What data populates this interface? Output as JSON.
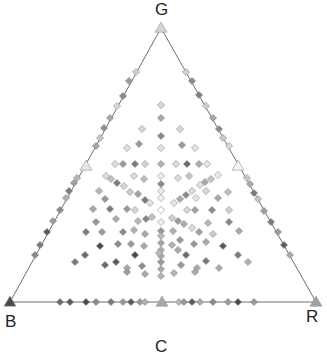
{
  "chart_data": {
    "type": "scatter",
    "subtype": "ternary",
    "title": "",
    "vertices": [
      {
        "label": "G",
        "x": 161,
        "y": 28,
        "marker": "triangle",
        "color": "#d4d4d4"
      },
      {
        "label": "B",
        "x": 10,
        "y": 302,
        "marker": "triangle",
        "color": "#4a4a4a"
      },
      {
        "label": "R",
        "x": 316,
        "y": 302,
        "marker": "triangle",
        "color": "#a0a0a0"
      }
    ],
    "edge_midpoints": [
      {
        "x": 86,
        "y": 166,
        "marker": "triangle",
        "color": "#e6e6e6"
      },
      {
        "x": 238,
        "y": 166,
        "marker": "triangle",
        "color": "#f4f4f4"
      },
      {
        "x": 162,
        "y": 302,
        "marker": "triangle",
        "color": "#a8a8a8"
      }
    ],
    "bottom_label_partial": "C",
    "points": [
      [
        136,
        72,
        "#d0d0d0"
      ],
      [
        129,
        81,
        "#9a9a9a"
      ],
      [
        123,
        96,
        "#8a8a8a"
      ],
      [
        117,
        106,
        "#d6d6d6"
      ],
      [
        110,
        118,
        "#a8a8a8"
      ],
      [
        104,
        128,
        "#8e8e8e"
      ],
      [
        100,
        138,
        "#c6c6c6"
      ],
      [
        96,
        146,
        "#a4a4a4"
      ],
      [
        77,
        178,
        "#b6b6b6"
      ],
      [
        74,
        183,
        "#9c9c9c"
      ],
      [
        69,
        191,
        "#7c7c7c"
      ],
      [
        66,
        198,
        "#b0b0b0"
      ],
      [
        60,
        210,
        "#8a8a8a"
      ],
      [
        53,
        221,
        "#9a9a9a"
      ],
      [
        47,
        232,
        "#5a5a5a"
      ],
      [
        40,
        245,
        "#7a7a7a"
      ],
      [
        35,
        255,
        "#888888"
      ],
      [
        186,
        72,
        "#d0d0d0"
      ],
      [
        192,
        81,
        "#8a8a8a"
      ],
      [
        199,
        95,
        "#7e7e7e"
      ],
      [
        206,
        106,
        "#cfcfcf"
      ],
      [
        213,
        118,
        "#a8a8a8"
      ],
      [
        219,
        129,
        "#8c8c8c"
      ],
      [
        223,
        138,
        "#c8c8c8"
      ],
      [
        229,
        146,
        "#d8d8d8"
      ],
      [
        247,
        178,
        "#c8c8c8"
      ],
      [
        250,
        184,
        "#a8a8a8"
      ],
      [
        254,
        193,
        "#7a7a7a"
      ],
      [
        258,
        199,
        "#c4c4c4"
      ],
      [
        264,
        211,
        "#9c9c9c"
      ],
      [
        271,
        222,
        "#7a7a7a"
      ],
      [
        278,
        232,
        "#9a9a9a"
      ],
      [
        284,
        245,
        "#5a5a5a"
      ],
      [
        290,
        255,
        "#aaaaaa"
      ],
      [
        60,
        302,
        "#6a6a6a"
      ],
      [
        70,
        302,
        "#5a5a5a"
      ],
      [
        86,
        302,
        "#4a4a4a"
      ],
      [
        96,
        302,
        "#888888"
      ],
      [
        111,
        302,
        "#777777"
      ],
      [
        123,
        302,
        "#999999"
      ],
      [
        131,
        302,
        "#5a5a5a"
      ],
      [
        140,
        302,
        "#999999"
      ],
      [
        145,
        302,
        "#b0b0b0"
      ],
      [
        179,
        302,
        "#b8b8b8"
      ],
      [
        184,
        302,
        "#999999"
      ],
      [
        192,
        302,
        "#5a5a5a"
      ],
      [
        200,
        302,
        "#a8a8a8"
      ],
      [
        213,
        302,
        "#888888"
      ],
      [
        228,
        302,
        "#999999"
      ],
      [
        238,
        302,
        "#4a4a4a"
      ],
      [
        254,
        302,
        "#9a9a9a"
      ],
      [
        161,
        105,
        "#d6d6d6"
      ],
      [
        161,
        118,
        "#a8a8a8"
      ],
      [
        161,
        136,
        "#8a8a8a"
      ],
      [
        161,
        148,
        "#e2e2e2"
      ],
      [
        161,
        164,
        "#b0b0b0"
      ],
      [
        161,
        176,
        "#eeeeee"
      ],
      [
        161,
        184,
        "#8a8a8a"
      ],
      [
        161,
        191,
        "#eeeeee"
      ],
      [
        161,
        198,
        "#f0f0f0"
      ],
      [
        161,
        210,
        "#ffffff"
      ],
      [
        161,
        222,
        "#f0f0f0"
      ],
      [
        161,
        231,
        "#999999"
      ],
      [
        161,
        236,
        "#b8b8b8"
      ],
      [
        161,
        243,
        "#a8a8a8"
      ],
      [
        161,
        250,
        "#b0b0b0"
      ],
      [
        161,
        256,
        "#aaaaaa"
      ],
      [
        161,
        262,
        "#999999"
      ],
      [
        161,
        269,
        "#aaaaaa"
      ],
      [
        161,
        276,
        "#b4b4b4"
      ],
      [
        142,
        129,
        "#d6d6d6"
      ],
      [
        180,
        129,
        "#d6d6d6"
      ],
      [
        139,
        144,
        "#9a9a9a"
      ],
      [
        182,
        145,
        "#9a9a9a"
      ],
      [
        127,
        148,
        "#e0e0e0"
      ],
      [
        195,
        148,
        "#e6e6e6"
      ],
      [
        115,
        164,
        "#dcdcdc"
      ],
      [
        123,
        164,
        "#9a9a9a"
      ],
      [
        135,
        164,
        "#7a7a7a"
      ],
      [
        145,
        164,
        "#d4d4d4"
      ],
      [
        176,
        164,
        "#dcdcdc"
      ],
      [
        187,
        164,
        "#6a6a6a"
      ],
      [
        199,
        164,
        "#aaaaaa"
      ],
      [
        207,
        164,
        "#e6e6e6"
      ],
      [
        106,
        176,
        "#dcdcdc"
      ],
      [
        111,
        179,
        "#c0c0c0"
      ],
      [
        117,
        183,
        "#7c7c7c"
      ],
      [
        124,
        186,
        "#d6d6d6"
      ],
      [
        134,
        176,
        "#dcdcdc"
      ],
      [
        144,
        179,
        "#bbbbbb"
      ],
      [
        178,
        178,
        "#dcdcdc"
      ],
      [
        189,
        176,
        "#c4c4c4"
      ],
      [
        200,
        185,
        "#e2e2e2"
      ],
      [
        205,
        182,
        "#aaaaaa"
      ],
      [
        211,
        179,
        "#c4c4c4"
      ],
      [
        218,
        175,
        "#ececec"
      ],
      [
        99,
        191,
        "#b8b8b8"
      ],
      [
        105,
        199,
        "#999999"
      ],
      [
        130,
        192,
        "#cccccc"
      ],
      [
        138,
        194,
        "#a0a0a0"
      ],
      [
        145,
        200,
        "#7a7a7a"
      ],
      [
        150,
        203,
        "#e6e6e6"
      ],
      [
        174,
        203,
        "#e6e6e6"
      ],
      [
        180,
        199,
        "#aaaaaa"
      ],
      [
        186,
        195,
        "#8a8a8a"
      ],
      [
        192,
        191,
        "#dcdcdc"
      ],
      [
        196,
        198,
        "#e6e6e6"
      ],
      [
        206,
        191,
        "#d6d6d6"
      ],
      [
        218,
        198,
        "#aaaaaa"
      ],
      [
        228,
        192,
        "#bcbcbc"
      ],
      [
        93,
        209,
        "#a8a8a8"
      ],
      [
        110,
        209,
        "#7a7a7a"
      ],
      [
        127,
        209,
        "#9a9a9a"
      ],
      [
        135,
        210,
        "#d6d6d6"
      ],
      [
        187,
        210,
        "#d6d6d6"
      ],
      [
        195,
        210,
        "#a0a0a0"
      ],
      [
        212,
        210,
        "#8a8a8a"
      ],
      [
        229,
        210,
        "#d0d0d0"
      ],
      [
        96,
        222,
        "#999999"
      ],
      [
        116,
        219,
        "#aaaaaa"
      ],
      [
        138,
        221,
        "#b8b8b8"
      ],
      [
        146,
        219,
        "#888888"
      ],
      [
        152,
        217,
        "#c0c0c0"
      ],
      [
        172,
        218,
        "#d0d0d0"
      ],
      [
        178,
        221,
        "#9a9a9a"
      ],
      [
        184,
        224,
        "#aaaaaa"
      ],
      [
        192,
        228,
        "#dcdcdc"
      ],
      [
        208,
        223,
        "#b6b6b6"
      ],
      [
        229,
        222,
        "#888888"
      ],
      [
        86,
        232,
        "#7a7a7a"
      ],
      [
        102,
        232,
        "#9a9a9a"
      ],
      [
        123,
        232,
        "#8a8a8a"
      ],
      [
        134,
        230,
        "#b0b0b0"
      ],
      [
        145,
        234,
        "#aaaaaa"
      ],
      [
        173,
        231,
        "#b0b0b0"
      ],
      [
        180,
        240,
        "#999999"
      ],
      [
        199,
        232,
        "#a0a0a0"
      ],
      [
        213,
        234,
        "#cccccc"
      ],
      [
        239,
        231,
        "#aaaaaa"
      ],
      [
        100,
        246,
        "#4a4a4a"
      ],
      [
        118,
        244,
        "#8a8a8a"
      ],
      [
        131,
        244,
        "#999999"
      ],
      [
        144,
        246,
        "#a8a8a8"
      ],
      [
        172,
        245,
        "#b0b0b0"
      ],
      [
        178,
        250,
        "#aaaaaa"
      ],
      [
        194,
        244,
        "#999999"
      ],
      [
        206,
        242,
        "#aaaaaa"
      ],
      [
        223,
        246,
        "#5a5a5a"
      ],
      [
        85,
        255,
        "#6a6a6a"
      ],
      [
        135,
        255,
        "#4a4a4a"
      ],
      [
        159,
        253,
        "#b8b8b8"
      ],
      [
        186,
        255,
        "#6a6a6a"
      ],
      [
        238,
        255,
        "#7a7a7a"
      ],
      [
        75,
        262,
        "#7a7a7a"
      ],
      [
        105,
        265,
        "#6a6a6a"
      ],
      [
        116,
        262,
        "#5a5a5a"
      ],
      [
        127,
        268,
        "#aaaaaa"
      ],
      [
        142,
        266,
        "#8a8a8a"
      ],
      [
        181,
        265,
        "#999999"
      ],
      [
        197,
        268,
        "#aaaaaa"
      ],
      [
        206,
        261,
        "#777777"
      ],
      [
        219,
        268,
        "#aaaaaa"
      ],
      [
        248,
        262,
        "#b0b0b0"
      ],
      [
        127,
        272,
        "#9c9c9c"
      ],
      [
        145,
        274,
        "#aaaaaa"
      ],
      [
        174,
        273,
        "#b4b4b4"
      ],
      [
        195,
        272,
        "#a8a8a8"
      ]
    ]
  },
  "labels": {
    "top": "G",
    "bottom_left": "B",
    "bottom_right": "R",
    "bottom_center_partial": "C"
  }
}
